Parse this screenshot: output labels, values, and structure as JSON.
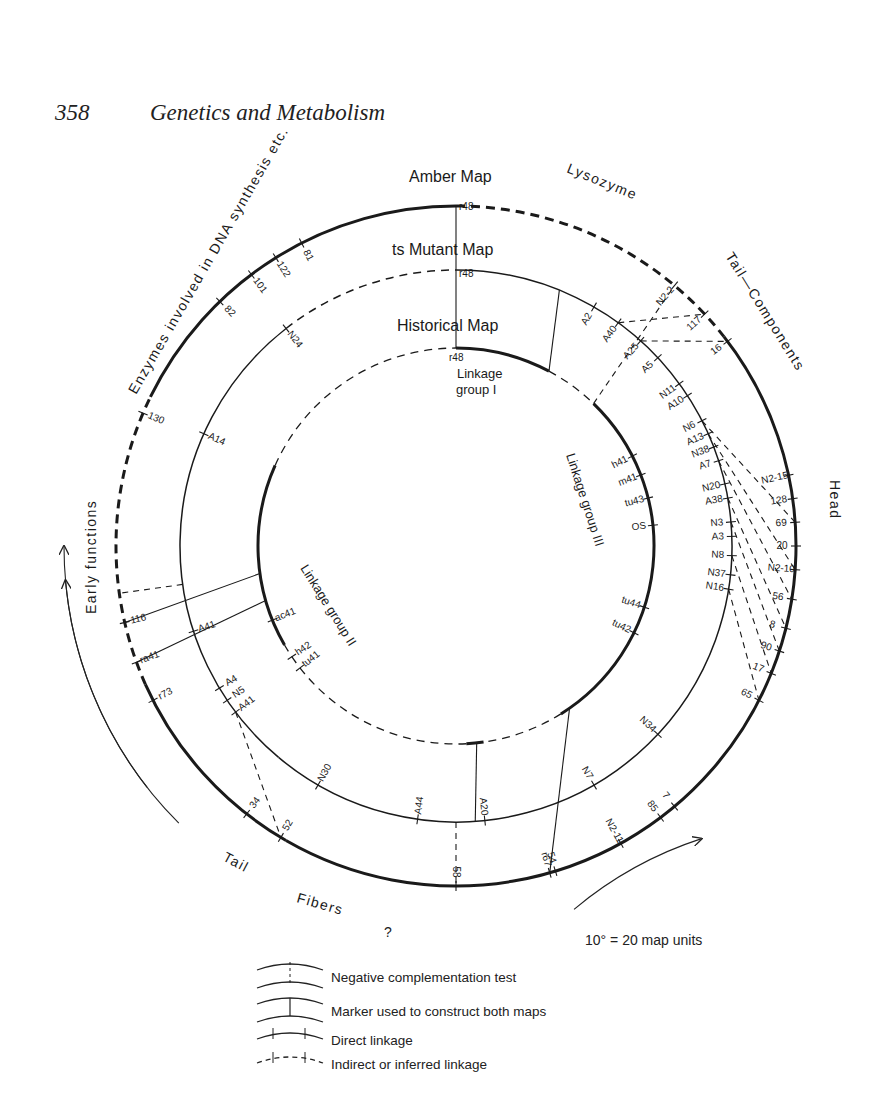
{
  "page": {
    "number": "358",
    "running_title": "Genetics and Metabolism"
  },
  "maps": {
    "amber_title": "Amber Map",
    "ts_title": "ts Mutant Map",
    "historical_title": "Historical Map",
    "linkage_group_1": "Linkage group I",
    "linkage_group_2": "Linkage group II",
    "linkage_group_3": "Linkage group III"
  },
  "regions": {
    "enzymes": "Enzymes involved in DNA synthesis etc.",
    "lysozyme": "Lysozyme",
    "tail_components": "Tail—Components",
    "head": "Head",
    "early_functions": "Early functions",
    "tail_fibers": "Tail—Fibers—?"
  },
  "scale_note": "10° = 20 map units",
  "legend": [
    {
      "symbol": "dashed-connector",
      "label": "Negative complementation test"
    },
    {
      "symbol": "solid-connector",
      "label": "Marker used to construct both maps"
    },
    {
      "symbol": "solid-line-ticks",
      "label": "Direct linkage"
    },
    {
      "symbol": "dashed-line-ticks",
      "label": "Indirect or inferred linkage"
    }
  ],
  "amber_markers": [
    "r48",
    "N2-2",
    "117",
    "16",
    "N2-15",
    "128",
    "69",
    "20",
    "N2-10",
    "56",
    "8",
    "90",
    "17",
    "65",
    "7",
    "85",
    "N2-11",
    "54",
    "r67",
    "58",
    "52",
    "34",
    "r73",
    "ra41",
    "116",
    "130",
    "82",
    "101",
    "122",
    "81"
  ],
  "ts_markers": [
    "r48",
    "e",
    "A2",
    "A40",
    "A25",
    "A5",
    "N11",
    "A10",
    "N6",
    "A13",
    "N38",
    "A7",
    "N20",
    "A38",
    "N3",
    "A3",
    "N8",
    "N37",
    "N16",
    "N34",
    "N7",
    "r67",
    "A20",
    "C",
    "A44",
    "N30",
    "A41",
    "N5",
    "A4",
    "r73",
    "ra41",
    "A41",
    "A14",
    "N24"
  ],
  "historical_markers": [
    "r48",
    "e",
    "tu45",
    "h41",
    "m41",
    "tu43",
    "OS",
    "tu44",
    "tu42",
    "r67",
    "C",
    "tu41",
    "h42",
    "ac41",
    "r73",
    "ra41"
  ]
}
